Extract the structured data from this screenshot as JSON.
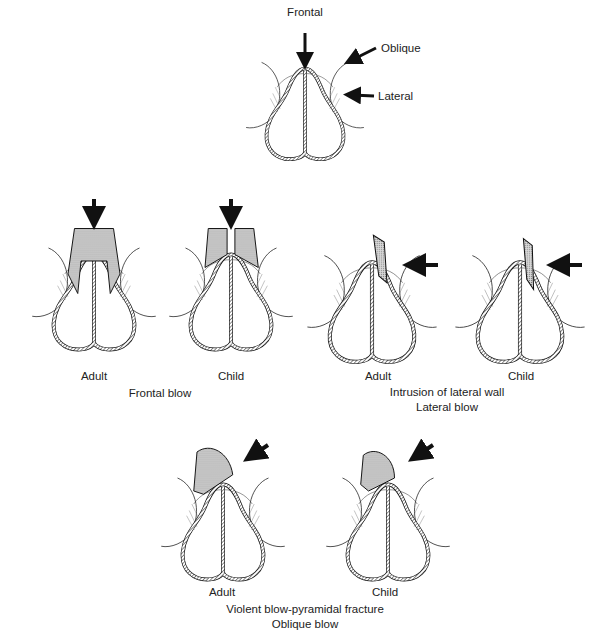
{
  "top": {
    "labels": {
      "frontal": "Frontal",
      "oblique": "Oblique",
      "lateral": "Lateral"
    }
  },
  "frontal_blow": {
    "adult": "Adult",
    "child": "Child",
    "caption": "Frontal blow"
  },
  "lateral_blow": {
    "adult": "Adult",
    "child": "Child",
    "caption_line1": "Intrusion of lateral wall",
    "caption_line2": "Lateral blow"
  },
  "oblique_blow": {
    "adult": "Adult",
    "child": "Child",
    "caption_line1": "Violent blow-pyramidal fracture",
    "caption_line2": "Oblique blow"
  },
  "colors": {
    "ink": "#1a1a1a",
    "background": "#ffffff",
    "stipple": "#9a9a9a"
  }
}
